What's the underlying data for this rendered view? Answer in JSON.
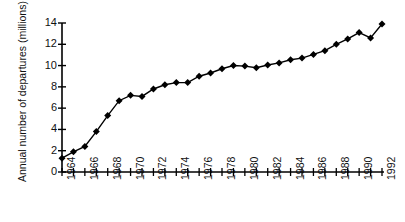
{
  "chart_data": {
    "type": "line",
    "title": "",
    "xlabel": "",
    "ylabel": "Annual number of departures (millions)",
    "x": [
      1964,
      1965,
      1966,
      1967,
      1968,
      1969,
      1970,
      1971,
      1972,
      1973,
      1974,
      1975,
      1976,
      1977,
      1978,
      1979,
      1980,
      1981,
      1982,
      1983,
      1984,
      1985,
      1986,
      1987,
      1988,
      1989,
      1990,
      1991,
      1992
    ],
    "values": [
      1.3,
      1.9,
      2.4,
      3.8,
      5.3,
      6.7,
      7.2,
      7.1,
      7.8,
      8.2,
      8.4,
      8.4,
      9.0,
      9.3,
      9.7,
      10.0,
      9.95,
      9.8,
      10.05,
      10.25,
      10.55,
      10.7,
      11.05,
      11.4,
      12.0,
      12.5,
      13.1,
      12.6,
      13.9
    ],
    "xlim": [
      1964,
      1992
    ],
    "ylim": [
      0,
      14
    ],
    "ytick_values": [
      0,
      2,
      4,
      6,
      8,
      10,
      12,
      14
    ],
    "ytick_labels": [
      "0",
      "2",
      "4",
      "6",
      "8",
      "10",
      "12",
      "14"
    ],
    "xtick_values": [
      1964,
      1966,
      1968,
      1970,
      1972,
      1974,
      1976,
      1978,
      1980,
      1982,
      1984,
      1986,
      1988,
      1990,
      1992
    ],
    "xtick_labels": [
      "1964",
      "1966",
      "1968",
      "1970",
      "1972",
      "1974",
      "1976",
      "1978",
      "1980",
      "1982",
      "1984",
      "1986",
      "1988",
      "1990",
      "1992"
    ],
    "xtick_minor_values": [
      1965,
      1967,
      1969,
      1971,
      1973,
      1975,
      1977,
      1979,
      1981,
      1983,
      1985,
      1987,
      1989,
      1991
    ],
    "grid": false,
    "legend": false,
    "marker": "diamond",
    "marker_color": "#000000",
    "line_color": "#000000"
  }
}
